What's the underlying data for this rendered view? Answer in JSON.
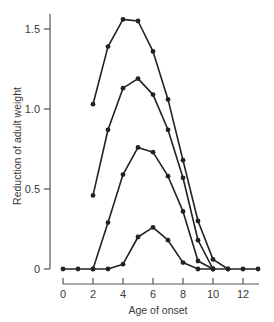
{
  "chart_data": {
    "type": "line",
    "title": "",
    "xlabel": "Age of onset",
    "ylabel": "Reduction of adult weight",
    "xlim": [
      0,
      13
    ],
    "ylim": [
      0,
      1.6
    ],
    "x_ticks": [
      0,
      2,
      4,
      6,
      8,
      10,
      12
    ],
    "y_ticks": [
      0,
      0.5,
      1.0,
      1.5
    ],
    "y_tick_labels": [
      "0",
      "0.5",
      "1.0",
      "1.5"
    ],
    "grid": false,
    "legend": null,
    "marker": "filled-circle",
    "series": [
      {
        "name": "curve-1",
        "x": [
          2,
          3,
          4,
          5,
          6,
          7,
          8,
          9,
          10,
          11
        ],
        "values": [
          1.03,
          1.39,
          1.56,
          1.55,
          1.36,
          1.06,
          0.68,
          0.3,
          0.06,
          0
        ]
      },
      {
        "name": "curve-2",
        "x": [
          2,
          3,
          4,
          5,
          6,
          7,
          8,
          9,
          10
        ],
        "values": [
          0.46,
          0.87,
          1.13,
          1.19,
          1.09,
          0.87,
          0.57,
          0.18,
          0
        ]
      },
      {
        "name": "curve-3",
        "x": [
          2,
          3,
          4,
          5,
          6,
          7,
          8,
          9,
          10
        ],
        "values": [
          0,
          0.29,
          0.59,
          0.76,
          0.73,
          0.58,
          0.36,
          0.05,
          0
        ]
      },
      {
        "name": "curve-4",
        "x": [
          0,
          1,
          2,
          3,
          4,
          5,
          6,
          7,
          8,
          9,
          10,
          11,
          12,
          13
        ],
        "values": [
          0,
          0,
          0,
          0,
          0.03,
          0.2,
          0.26,
          0.18,
          0.04,
          0,
          0,
          0,
          0,
          0
        ]
      }
    ]
  },
  "colors": {
    "ink": "#222222",
    "axis": "#555555",
    "background": "#ffffff"
  }
}
